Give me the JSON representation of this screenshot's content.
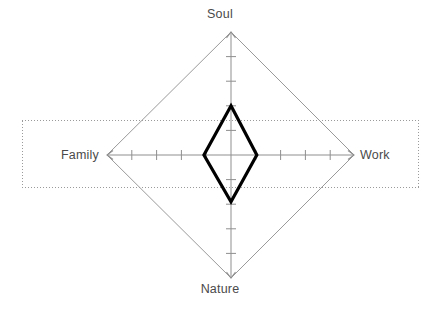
{
  "chart_data": {
    "type": "radar",
    "title": "",
    "subtitle": "",
    "xlabel": "",
    "ylabel": "",
    "axes": [
      "Soul",
      "Work",
      "Nature",
      "Family"
    ],
    "axis_order_deg": [
      90,
      0,
      270,
      180
    ],
    "categories": [
      "Soul",
      "Work",
      "Nature",
      "Family"
    ],
    "values": [
      0.4,
      0.21,
      0.38,
      0.22
    ],
    "series": [
      {
        "name": "Balance",
        "values": [
          0.4,
          0.21,
          0.38,
          0.22
        ],
        "line_color": "#000000",
        "line_width": 3.2,
        "fill": "none"
      }
    ],
    "axis_max": 1.0,
    "axis_min": 0.0,
    "ticks_per_axis": 4,
    "tick_values": [
      0.2,
      0.4,
      0.6,
      0.8
    ],
    "grid": false,
    "legend": "none",
    "outer_ring_color": "#9a9a9a",
    "axis_color": "#8f8f8f",
    "tick_color": "#8f8f8f",
    "background": "#ffffff",
    "annotations": [
      {
        "name": "horizontal-focus-band",
        "shape": "rectangle",
        "style": "dotted",
        "color": "#9a9a9a",
        "spans_axes": [
          "Family",
          "Work"
        ]
      }
    ]
  },
  "labels": {
    "soul": "Soul",
    "work": "Work",
    "nature": "Nature",
    "family": "Family"
  },
  "colors": {
    "data_stroke": "#000000",
    "frame": "#9a9a9a",
    "axis": "#8f8f8f",
    "label_text": "#4a4a4a",
    "dotted_box": "#9a9a9a",
    "background": "#ffffff"
  },
  "geometry": {
    "center_x": 231,
    "center_y": 155,
    "radius_x": 123,
    "radius_y": 123,
    "dotted_box": {
      "left": 22,
      "top": 120,
      "right": 418,
      "bottom": 187
    }
  }
}
